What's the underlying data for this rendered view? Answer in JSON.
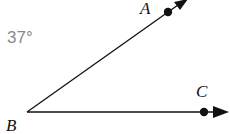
{
  "diagram": {
    "type": "angle",
    "angle_label": "37°",
    "angle_measure_degrees": 37,
    "vertex": {
      "label": "B",
      "x": 27,
      "y": 112
    },
    "rays": [
      {
        "name": "ray-BA",
        "through_point": {
          "label": "A",
          "x": 168,
          "y": 12
        },
        "end": {
          "x": 187,
          "y": 0
        }
      },
      {
        "name": "ray-BC",
        "through_point": {
          "label": "C",
          "x": 204,
          "y": 112
        },
        "end": {
          "x": 228,
          "y": 112
        }
      }
    ],
    "labels": {
      "A": "A",
      "B": "B",
      "C": "C"
    },
    "colors": {
      "stroke": "#111111",
      "angle_text": "#8a8a8a",
      "background": "#ffffff"
    }
  }
}
